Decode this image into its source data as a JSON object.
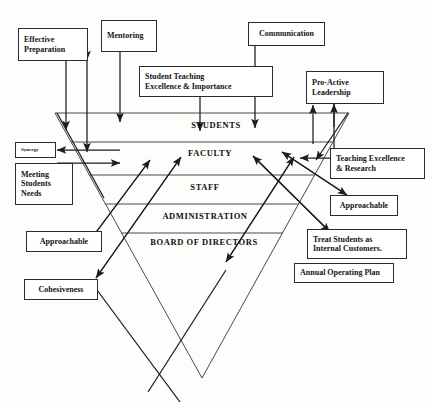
{
  "figure": {
    "kind": "inverted-pyramid-influence-diagram",
    "background_color": "#fdfdfb",
    "line_color": "#2b2b2b",
    "text_color": "#141414"
  },
  "pyramid": {
    "tiers": [
      {
        "label": "STUDENTS",
        "font_size": 8.5
      },
      {
        "label": "FACULTY",
        "font_size": 8.5
      },
      {
        "label": "STAFF",
        "font_size": 8.5
      },
      {
        "label": "ADMINISTRATION",
        "font_size": 8.5
      },
      {
        "label": "BOARD OF DIRECTORS",
        "font_size": 8.5
      }
    ]
  },
  "boxes": [
    {
      "id": "effective-preparation",
      "lines": [
        "Effective",
        "Preparation"
      ],
      "align": "left",
      "font_size": 8
    },
    {
      "id": "mentoring",
      "lines": [
        "Mentoring"
      ],
      "align": "left",
      "font_size": 8
    },
    {
      "id": "communication",
      "lines": [
        "Communication"
      ],
      "align": "center",
      "font_size": 8
    },
    {
      "id": "student-teaching-excellence",
      "lines": [
        "Student Teaching",
        "Excellence & Importance"
      ],
      "align": "left",
      "font_size": 8
    },
    {
      "id": "pro-active-leadership",
      "lines": [
        "Pro-Active",
        "Leadership"
      ],
      "align": "left",
      "font_size": 8
    },
    {
      "id": "synergy",
      "lines": [
        "Synergy"
      ],
      "align": "left",
      "font_size": 5
    },
    {
      "id": "meeting-students-needs",
      "lines": [
        "Meeting",
        "Students",
        "Needs"
      ],
      "align": "left",
      "font_size": 8
    },
    {
      "id": "teaching-excellence-research",
      "lines": [
        "Teaching Excellence",
        "& Research"
      ],
      "align": "left",
      "font_size": 8
    },
    {
      "id": "approachable-right",
      "lines": [
        "Approachable"
      ],
      "align": "center",
      "font_size": 8
    },
    {
      "id": "approachable-left",
      "lines": [
        "Approachable"
      ],
      "align": "center",
      "font_size": 8
    },
    {
      "id": "treat-students-internal-customers",
      "lines": [
        "Treat Students as",
        "Internal Customers."
      ],
      "align": "left",
      "font_size": 8
    },
    {
      "id": "annual-operating-plan",
      "lines": [
        "Annual Operating Plan"
      ],
      "align": "left",
      "font_size": 8
    },
    {
      "id": "cohesiveness",
      "lines": [
        "Cohesiveness"
      ],
      "align": "center",
      "font_size": 8
    }
  ]
}
